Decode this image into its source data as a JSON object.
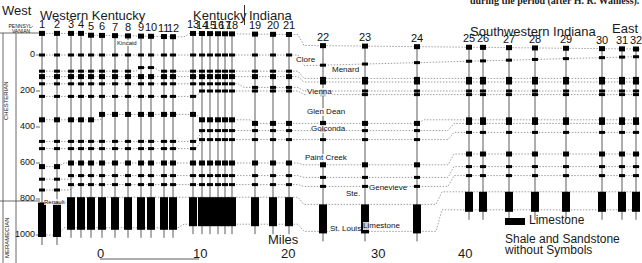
{
  "caption": "during the period (after H. R. Wanless).",
  "directions": {
    "west": "West",
    "east": "East"
  },
  "regions": [
    {
      "label": "Western Kentucky",
      "x": 40,
      "y": 9
    },
    {
      "label": "Kentucky",
      "x": 193,
      "y": 9
    },
    {
      "label": "Indiana",
      "x": 249,
      "y": 9
    },
    {
      "label": "Southwestern Indiana",
      "x": 470,
      "y": 25
    }
  ],
  "systems": {
    "top": "PENNSYL-\nVANIAN",
    "middle": "CHESTERIAN",
    "bottom": "MERAMECIAN"
  },
  "depth_axis": {
    "unit": "feet",
    "ticks": [
      {
        "label": "0",
        "value": 0
      },
      {
        "label": "200",
        "value": 200
      },
      {
        "label": "400",
        "value": 400
      },
      {
        "label": "600",
        "value": 600
      },
      {
        "label": "800",
        "value": 800
      },
      {
        "label": "1000",
        "value": 1000
      }
    ]
  },
  "formations": [
    {
      "label": "Kincaid",
      "x": 117,
      "y": 40
    },
    {
      "label": "Clore",
      "x": 296,
      "y": 56
    },
    {
      "label": "Menard",
      "x": 332,
      "y": 66
    },
    {
      "label": "Vienna",
      "x": 307,
      "y": 88
    },
    {
      "label": "Glen Dean",
      "x": 307,
      "y": 108
    },
    {
      "label": "Golconda",
      "x": 311,
      "y": 125
    },
    {
      "label": "Paint Creek",
      "x": 305,
      "y": 154
    },
    {
      "label": "Ste.",
      "x": 346,
      "y": 190
    },
    {
      "label": "Genevieve",
      "x": 369,
      "y": 184
    },
    {
      "label": "St. Louis",
      "x": 330,
      "y": 225
    },
    {
      "label": "Limestone",
      "x": 363,
      "y": 222
    },
    {
      "label": "Renault",
      "x": 44,
      "y": 199
    }
  ],
  "wells": [
    {
      "id": "1",
      "x": 42
    },
    {
      "id": "2",
      "x": 57
    },
    {
      "id": "3",
      "x": 71
    },
    {
      "id": "4",
      "x": 81
    },
    {
      "id": "5",
      "x": 91
    },
    {
      "id": "6",
      "x": 102
    },
    {
      "id": "7",
      "x": 115
    },
    {
      "id": "8",
      "x": 128
    },
    {
      "id": "9",
      "x": 141
    },
    {
      "id": "10",
      "x": 151
    },
    {
      "id": "11",
      "x": 164
    },
    {
      "id": "12",
      "x": 173
    },
    {
      "id": "13",
      "x": 193
    },
    {
      "id": "14",
      "x": 202
    },
    {
      "id": "15",
      "x": 210
    },
    {
      "id": "16",
      "x": 218
    },
    {
      "id": "17",
      "x": 225
    },
    {
      "id": "18",
      "x": 232
    },
    {
      "id": "19",
      "x": 255
    },
    {
      "id": "20",
      "x": 273
    },
    {
      "id": "21",
      "x": 289
    },
    {
      "id": "22",
      "x": 323
    },
    {
      "id": "23",
      "x": 365
    },
    {
      "id": "24",
      "x": 417
    },
    {
      "id": "25",
      "x": 469
    },
    {
      "id": "26",
      "x": 483
    },
    {
      "id": "27",
      "x": 509
    },
    {
      "id": "28",
      "x": 535
    },
    {
      "id": "29",
      "x": 566
    },
    {
      "id": "30",
      "x": 602
    },
    {
      "id": "31",
      "x": 622
    },
    {
      "id": "32",
      "x": 636
    }
  ],
  "scale_bar": {
    "title": "Miles",
    "ticks": [
      {
        "label": "0",
        "x": 97
      },
      {
        "label": "10",
        "x": 193
      },
      {
        "label": "20",
        "x": 281
      },
      {
        "label": "30",
        "x": 371
      },
      {
        "label": "40",
        "x": 458
      }
    ]
  },
  "legend": {
    "limestone": "Limestone",
    "note_line1": "Shale and Sandstone",
    "note_line2": "without Symbols"
  },
  "colors": {
    "ink": "#111111",
    "background": "#ffffff",
    "grid": "#777777"
  }
}
